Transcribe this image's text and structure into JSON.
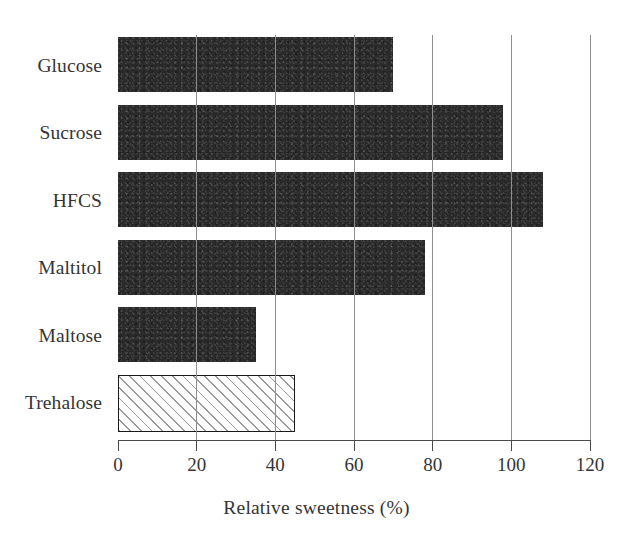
{
  "chart_data": {
    "type": "bar",
    "orientation": "horizontal",
    "title": "",
    "xlabel": "Relative sweetness (%)",
    "ylabel": "",
    "categories": [
      "Glucose",
      "Sucrose",
      "HFCS",
      "Maltitol",
      "Maltose",
      "Trehalose"
    ],
    "values": [
      70,
      98,
      108,
      78,
      35,
      45
    ],
    "series": [
      {
        "name": "Relative sweetness (%)",
        "values": [
          70,
          98,
          108,
          78,
          35,
          45
        ]
      }
    ],
    "xlim": [
      0,
      120
    ],
    "xticks": [
      0,
      20,
      40,
      60,
      80,
      100,
      120
    ],
    "xtick_labels": [
      "0",
      "20",
      "40",
      "60",
      "80",
      "100",
      "120"
    ],
    "grid": "vertical",
    "legend": "none",
    "bar_styles": [
      {
        "category": "Glucose",
        "fill": "solid",
        "color": "#2a2a2a"
      },
      {
        "category": "Sucrose",
        "fill": "solid",
        "color": "#2a2a2a"
      },
      {
        "category": "HFCS",
        "fill": "solid",
        "color": "#2a2a2a"
      },
      {
        "category": "Maltitol",
        "fill": "solid",
        "color": "#2a2a2a"
      },
      {
        "category": "Maltose",
        "fill": "solid",
        "color": "#2a2a2a"
      },
      {
        "category": "Trehalose",
        "fill": "hatched",
        "color": "#ffffff",
        "hatch": "/",
        "edge_color": "#1a1a1a"
      }
    ],
    "colors": {
      "bar_solid": "#2a2a2a",
      "bar_hatch_line": "#9a9a9a",
      "bar_hatch_background": "#ffffff",
      "grid": "#8e8e8e",
      "axis": "#4a4a4a",
      "text": "#353535",
      "background": "#ffffff"
    }
  }
}
